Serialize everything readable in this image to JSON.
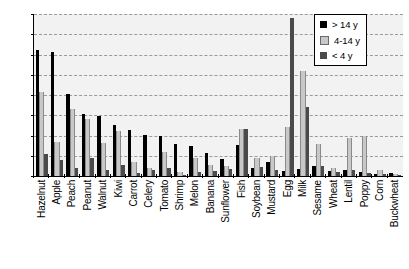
{
  "chart_data": {
    "type": "bar",
    "title": "",
    "subtitle": "",
    "xlabel": "",
    "ylabel": "",
    "ylim": [
      0,
      40
    ],
    "yticks": [
      0,
      5,
      10,
      15,
      20,
      25,
      30,
      35,
      40
    ],
    "grid": true,
    "legend_position": "top-right",
    "categories": [
      "Hazelnut",
      "Apple",
      "Peach",
      "Peanut",
      "Walnut",
      "Kiwi",
      "Carrot",
      "Celery",
      "Tomato",
      "Shrimp",
      "Melon",
      "Banana",
      "Sunflower",
      "Fish",
      "Soybean",
      "Mustard",
      "Egg",
      "Milk",
      "Sesame",
      "Wheat",
      "Lentil",
      "Poppy",
      "Corn",
      "Buckwheat"
    ],
    "series": [
      {
        "name": "> 14 y",
        "color": "#000000",
        "values": [
          31.2,
          30.5,
          20.2,
          15.2,
          14.8,
          12.5,
          11.3,
          10.2,
          9.8,
          8.0,
          7.5,
          5.8,
          4.2,
          7.7,
          2.0,
          3.5,
          1.2,
          1.7,
          2.5,
          1.3,
          1.5,
          1.0,
          0.5,
          0.8
        ]
      },
      {
        "name": "4-14 y",
        "color": "#c8c8c8",
        "values": [
          20.8,
          8.5,
          16.5,
          14.0,
          8.2,
          11.2,
          3.5,
          2.0,
          6.0,
          1.0,
          4.5,
          2.8,
          2.5,
          11.5,
          4.5,
          5.0,
          12.0,
          26.0,
          8.0,
          2.0,
          9.5,
          9.8,
          1.5,
          0.4
        ]
      },
      {
        "name": "< 4 y",
        "color": "#4a4a4a",
        "values": [
          5.5,
          4.0,
          2.0,
          4.5,
          1.5,
          2.8,
          0.8,
          1.5,
          2.0,
          0.3,
          1.0,
          1.2,
          1.8,
          11.5,
          2.2,
          1.5,
          39.0,
          17.0,
          2.5,
          1.0,
          1.5,
          0.8,
          0.5,
          0.3
        ]
      }
    ]
  },
  "legend": {
    "items": [
      {
        "label": "> 14 y"
      },
      {
        "label": "4-14 y"
      },
      {
        "label": "< 4 y"
      }
    ]
  }
}
